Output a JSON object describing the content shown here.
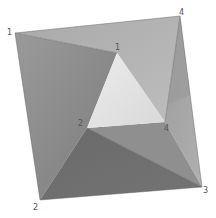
{
  "diagram": {
    "colors": {
      "background": "#ffffff",
      "face_top": "#b4b4b4",
      "face_left": "#8e8e8e",
      "face_right": "#a6a6a6",
      "face_bottom": "#6f6f6f",
      "face_bottom_right": "#8a8a8a",
      "inner_triangle": "#e2e2e2",
      "edge": "#5a5a5a",
      "label": "#555555"
    },
    "vertices": {
      "outer_1": {
        "label": "1",
        "x": 15,
        "y": 33
      },
      "outer_4": {
        "label": "4",
        "x": 180,
        "y": 16
      },
      "outer_3": {
        "label": "3",
        "x": 202,
        "y": 187
      },
      "outer_2": {
        "label": "2",
        "x": 40,
        "y": 200
      },
      "inner_1": {
        "label": "1",
        "x": 117,
        "y": 53
      },
      "inner_2": {
        "label": "2",
        "x": 87,
        "y": 128
      },
      "inner_4": {
        "label": "4",
        "x": 165,
        "y": 122
      }
    },
    "labels": {
      "outer_1": "1",
      "outer_4": "4",
      "outer_3": "3",
      "outer_2": "2",
      "inner_1": "1",
      "inner_2": "2",
      "inner_4": "4"
    }
  }
}
